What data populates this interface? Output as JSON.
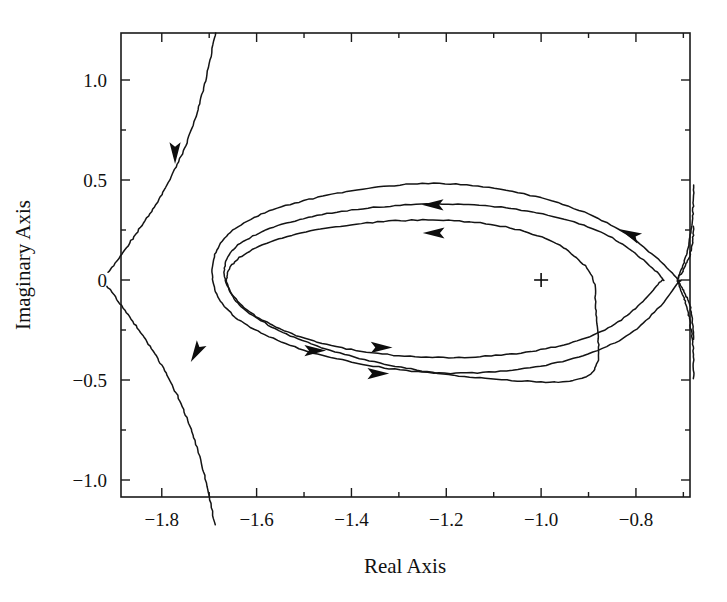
{
  "figure": {
    "kind": "root-locus-plot",
    "background_color": "#ffffff",
    "line_color": "#141414"
  },
  "axes": {
    "x_title": "Real Axis",
    "y_title": "Imaginary Axis",
    "x_ticks": [
      "-1.8",
      "-1.6",
      "-1.4",
      "-1.2",
      "-1.0",
      "-0.8"
    ],
    "y_ticks": [
      "1.0",
      "0.5",
      "0",
      "-0.5",
      "-1.0"
    ]
  },
  "chart_data": {
    "type": "line",
    "title": "",
    "xlabel": "Real Axis",
    "ylabel": "Imaginary Axis",
    "xlim": [
      -1.886,
      -0.686
    ],
    "ylim": [
      -1.085,
      1.235
    ],
    "xticks": [
      -1.8,
      -1.6,
      -1.4,
      -1.2,
      -1.0,
      -0.8
    ],
    "xticklabels": [
      "-1.8",
      "-1.6",
      "-1.4",
      "-1.2",
      "-1.0",
      "-0.8"
    ],
    "yticks": [
      1.0,
      0.5,
      0,
      -0.5,
      -1.0
    ],
    "yticklabels": [
      "1.0",
      "0.5",
      "0",
      "-0.5",
      "-1.0"
    ],
    "grid": false,
    "legend": null,
    "minor_xticks": [
      -1.9,
      -1.7,
      -1.5,
      -1.3,
      -1.1,
      -0.9,
      -0.7
    ],
    "minor_yticks": [
      0.75,
      0.25,
      -0.25,
      -0.75
    ],
    "markers": [
      {
        "name": "open-loop-pole-or-zero",
        "symbol": "+",
        "x": -1.0,
        "y": 0.0
      }
    ],
    "series": [
      {
        "name": "outer-loop",
        "closed": true,
        "points": [
          [
            -0.712,
            0.005
          ],
          [
            -0.76,
            0.118
          ],
          [
            -0.82,
            0.23
          ],
          [
            -0.9,
            0.33
          ],
          [
            -1.0,
            0.41
          ],
          [
            -1.11,
            0.462
          ],
          [
            -1.215,
            0.482
          ],
          [
            -1.32,
            0.47
          ],
          [
            -1.42,
            0.437
          ],
          [
            -1.51,
            0.39
          ],
          [
            -1.59,
            0.328
          ],
          [
            -1.65,
            0.248
          ],
          [
            -1.684,
            0.15
          ],
          [
            -1.694,
            0.04
          ],
          [
            -1.684,
            -0.072
          ],
          [
            -1.65,
            -0.175
          ],
          [
            -1.59,
            -0.265
          ],
          [
            -1.51,
            -0.342
          ],
          [
            -1.42,
            -0.4
          ],
          [
            -1.32,
            -0.443
          ],
          [
            -1.215,
            -0.465
          ],
          [
            -1.11,
            -0.46
          ],
          [
            -1.0,
            -0.43
          ],
          [
            -0.9,
            -0.37
          ],
          [
            -0.82,
            -0.28
          ],
          [
            -0.76,
            -0.16
          ],
          [
            -0.712,
            -0.015
          ]
        ]
      },
      {
        "name": "middle-loop",
        "closed": true,
        "points": [
          [
            -0.745,
            0.01
          ],
          [
            -0.79,
            0.11
          ],
          [
            -0.85,
            0.21
          ],
          [
            -0.93,
            0.29
          ],
          [
            -1.03,
            0.345
          ],
          [
            -1.13,
            0.374
          ],
          [
            -1.23,
            0.38
          ],
          [
            -1.33,
            0.368
          ],
          [
            -1.43,
            0.34
          ],
          [
            -1.52,
            0.296
          ],
          [
            -1.595,
            0.235
          ],
          [
            -1.648,
            0.155
          ],
          [
            -1.668,
            0.062
          ],
          [
            -1.66,
            -0.038
          ],
          [
            -1.625,
            -0.14
          ],
          [
            -1.565,
            -0.228
          ],
          [
            -1.49,
            -0.298
          ],
          [
            -1.4,
            -0.348
          ],
          [
            -1.3,
            -0.378
          ],
          [
            -1.195,
            -0.388
          ],
          [
            -1.095,
            -0.378
          ],
          [
            -1.0,
            -0.348
          ],
          [
            -0.915,
            -0.298
          ],
          [
            -0.845,
            -0.22
          ],
          [
            -0.79,
            -0.118
          ],
          [
            -0.75,
            -0.012
          ]
        ]
      },
      {
        "name": "inner-loop",
        "closed": true,
        "points": [
          [
            -0.89,
            0.005
          ],
          [
            -0.92,
            0.1
          ],
          [
            -0.975,
            0.19
          ],
          [
            -1.055,
            0.255
          ],
          [
            -1.15,
            0.29
          ],
          [
            -1.25,
            0.3
          ],
          [
            -1.355,
            0.288
          ],
          [
            -1.455,
            0.258
          ],
          [
            -1.545,
            0.21
          ],
          [
            -1.615,
            0.145
          ],
          [
            -1.655,
            0.066
          ],
          [
            -1.662,
            -0.02
          ],
          [
            -1.64,
            -0.115
          ],
          [
            -1.59,
            -0.205
          ],
          [
            -1.52,
            -0.288
          ],
          [
            -1.435,
            -0.358
          ],
          [
            -1.34,
            -0.415
          ],
          [
            -1.24,
            -0.458
          ],
          [
            -1.14,
            -0.488
          ],
          [
            -1.04,
            -0.505
          ],
          [
            -0.955,
            -0.508
          ],
          [
            -0.9,
            -0.478
          ],
          [
            -0.88,
            -0.4
          ],
          [
            -0.88,
            -0.28
          ],
          [
            -0.885,
            -0.14
          ]
        ]
      },
      {
        "name": "upper-left-asymptote-branch",
        "closed": false,
        "points": [
          [
            -1.687,
            1.235
          ],
          [
            -1.7,
            1.08
          ],
          [
            -1.715,
            0.93
          ],
          [
            -1.732,
            0.79
          ],
          [
            -1.752,
            0.66
          ],
          [
            -1.775,
            0.54
          ],
          [
            -1.8,
            0.428
          ],
          [
            -1.828,
            0.32
          ],
          [
            -1.858,
            0.218
          ],
          [
            -1.888,
            0.118
          ],
          [
            -1.915,
            0.03
          ]
        ]
      },
      {
        "name": "lower-left-asymptote-branch",
        "closed": false,
        "points": [
          [
            -1.915,
            -0.03
          ],
          [
            -1.888,
            -0.118
          ],
          [
            -1.858,
            -0.218
          ],
          [
            -1.828,
            -0.32
          ],
          [
            -1.8,
            -0.428
          ],
          [
            -1.775,
            -0.54
          ],
          [
            -1.752,
            -0.66
          ],
          [
            -1.732,
            -0.79
          ],
          [
            -1.715,
            -0.93
          ],
          [
            -1.7,
            -1.08
          ],
          [
            -1.687,
            -1.235
          ]
        ]
      },
      {
        "name": "right-upper-branch-a",
        "closed": false,
        "points": [
          [
            -0.712,
            0.005
          ],
          [
            -0.7,
            0.08
          ],
          [
            -0.69,
            0.165
          ],
          [
            -0.683,
            0.26
          ],
          [
            -0.679,
            0.37
          ],
          [
            -0.678,
            0.48
          ]
        ]
      },
      {
        "name": "right-upper-branch-b",
        "closed": false,
        "points": [
          [
            -0.712,
            0.005
          ],
          [
            -0.698,
            0.06
          ],
          [
            -0.686,
            0.13
          ],
          [
            -0.68,
            0.205
          ],
          [
            -0.678,
            0.275
          ]
        ]
      },
      {
        "name": "right-lower-branch-a",
        "closed": false,
        "points": [
          [
            -0.712,
            -0.005
          ],
          [
            -0.7,
            -0.08
          ],
          [
            -0.69,
            -0.165
          ],
          [
            -0.683,
            -0.26
          ],
          [
            -0.679,
            -0.37
          ],
          [
            -0.678,
            -0.5
          ]
        ]
      },
      {
        "name": "right-lower-branch-b",
        "closed": false,
        "points": [
          [
            -0.712,
            -0.005
          ],
          [
            -0.698,
            -0.06
          ],
          [
            -0.686,
            -0.13
          ],
          [
            -0.68,
            -0.22
          ],
          [
            -0.678,
            -0.3
          ]
        ]
      }
    ],
    "arrows": [
      {
        "name": "arrow-upper-left-branch",
        "x": -1.772,
        "y": 0.655,
        "direction": "down"
      },
      {
        "name": "arrow-lower-left-branch",
        "x": -1.723,
        "y": -0.345,
        "direction": "down-left"
      },
      {
        "name": "arrow-middle-loop-top",
        "x": -1.22,
        "y": 0.376,
        "direction": "left"
      },
      {
        "name": "arrow-inner-loop-top",
        "x": -1.218,
        "y": 0.235,
        "direction": "left"
      },
      {
        "name": "arrow-outer-loop-right-upper",
        "x": -0.805,
        "y": 0.222,
        "direction": "up-left"
      },
      {
        "name": "arrow-middle-loop-bottom",
        "x": -1.345,
        "y": -0.337,
        "direction": "right"
      },
      {
        "name": "arrow-outer-loop-bottom",
        "x": -1.485,
        "y": -0.353,
        "direction": "right"
      },
      {
        "name": "arrow-inner-loop-bottom",
        "x": -1.352,
        "y": -0.468,
        "direction": "right"
      }
    ]
  }
}
